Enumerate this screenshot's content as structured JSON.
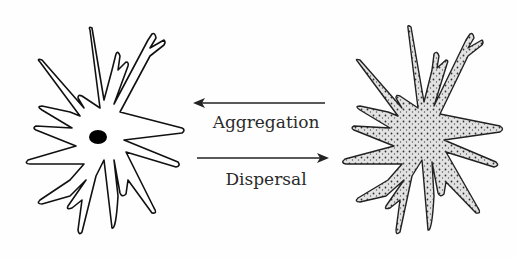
{
  "diagram": {
    "type": "cell-state-transition",
    "left_cell": {
      "name": "dispersed-cell",
      "style": "outline",
      "has_nucleus": true
    },
    "right_cell": {
      "name": "aggregated-cell",
      "style": "stippled"
    },
    "arrows": [
      {
        "direction": "right-to-left",
        "label": "Aggregation"
      },
      {
        "direction": "left-to-right",
        "label": "Dispersal"
      }
    ],
    "colors": {
      "line": "#111111",
      "stipple_fill": "#d9d9d9",
      "background": "#fefefe"
    }
  }
}
